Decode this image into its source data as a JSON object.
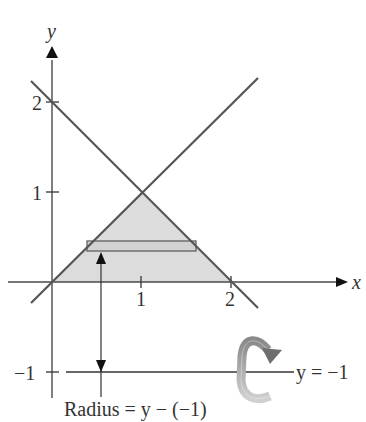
{
  "figure": {
    "colors": {
      "axis": "#4a4a4a",
      "curve": "#555555",
      "region_fill": "#dcdcdc",
      "rect_stroke": "#555555",
      "rotation_arrow": "#9a9a9a",
      "rotation_arrow_head": "#6e6e6e",
      "text": "#333333"
    },
    "axes": {
      "x_label": "x",
      "y_label": "y",
      "x_ticks": [
        {
          "value": 1,
          "label": "1"
        },
        {
          "value": 2,
          "label": "2"
        }
      ],
      "y_ticks": [
        {
          "value": 2,
          "label": "2"
        },
        {
          "value": 1,
          "label": "1"
        },
        {
          "value": -1,
          "label": "−1"
        }
      ]
    },
    "curves": [
      {
        "name": "line-y-equals-x",
        "equation": "y = x"
      },
      {
        "name": "line-y-equals-2-minus-x",
        "equation": "y = 2 − x"
      }
    ],
    "region": {
      "vertices": [
        [
          0,
          0
        ],
        [
          1,
          1
        ],
        [
          2,
          0
        ]
      ],
      "description": "Shaded triangular region"
    },
    "representative_rectangle": {
      "orientation": "horizontal",
      "y": 0.4
    },
    "axis_of_revolution": {
      "label": "y = −1",
      "value": -1
    },
    "radius_label": "Radius = y − (−1)"
  }
}
